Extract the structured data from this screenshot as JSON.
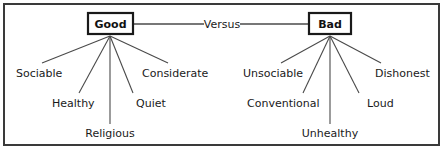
{
  "diagram": {
    "frame": {
      "stroke_color": "#3a3a3a",
      "background_color": "#ffffff"
    },
    "relation_label": "Versus",
    "nodes": [
      {
        "id": "good",
        "label": "Good",
        "box": {
          "x": 88,
          "y": 13,
          "w": 45,
          "h": 21
        },
        "hub": {
          "x": 110,
          "y": 35
        }
      },
      {
        "id": "bad",
        "label": "Bad",
        "box": {
          "x": 309,
          "y": 13,
          "w": 42,
          "h": 21
        },
        "hub": {
          "x": 330,
          "y": 35
        }
      }
    ],
    "good_traits": [
      {
        "label": "Sociable",
        "anchor": "start",
        "tx": 16,
        "ty": 73,
        "lx": 42,
        "ly": 63
      },
      {
        "label": "Healthy",
        "anchor": "start",
        "tx": 52,
        "ty": 103,
        "lx": 79,
        "ly": 93
      },
      {
        "label": "Religious",
        "anchor": "middle",
        "tx": 110,
        "ty": 133,
        "lx": 110,
        "ly": 124
      },
      {
        "label": "Quiet",
        "anchor": "start",
        "tx": 136,
        "ty": 103,
        "lx": 133,
        "ly": 93
      },
      {
        "label": "Considerate",
        "anchor": "start",
        "tx": 142,
        "ty": 73,
        "lx": 168,
        "ly": 63
      }
    ],
    "bad_traits": [
      {
        "label": "Unsociable",
        "anchor": "start",
        "tx": 243,
        "ty": 73,
        "lx": 281,
        "ly": 63
      },
      {
        "label": "Conventional",
        "anchor": "start",
        "tx": 247,
        "ty": 103,
        "lx": 303,
        "ly": 93
      },
      {
        "label": "Unhealthy",
        "anchor": "middle",
        "tx": 330,
        "ty": 133,
        "lx": 330,
        "ly": 124
      },
      {
        "label": "Loud",
        "anchor": "start",
        "tx": 367,
        "ty": 103,
        "lx": 359,
        "ly": 93
      },
      {
        "label": "Dishonest",
        "anchor": "start",
        "tx": 375,
        "ty": 73,
        "lx": 381,
        "ly": 63
      }
    ]
  }
}
